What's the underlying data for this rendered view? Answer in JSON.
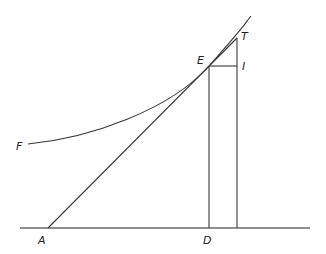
{
  "diagram": {
    "type": "geometric-construction",
    "labels": {
      "A": "A",
      "D": "D",
      "E": "E",
      "F": "F",
      "T": "T",
      "I": "I"
    },
    "points": {
      "A": [
        48,
        228
      ],
      "D": [
        209,
        228
      ],
      "E": [
        209,
        66
      ],
      "T": [
        237,
        38
      ],
      "I": [
        237,
        66
      ],
      "F": [
        28,
        144
      ]
    },
    "colors": {
      "line": "#3a3a3a",
      "baseline": "#6a6a6a",
      "background": "#ffffff"
    }
  }
}
